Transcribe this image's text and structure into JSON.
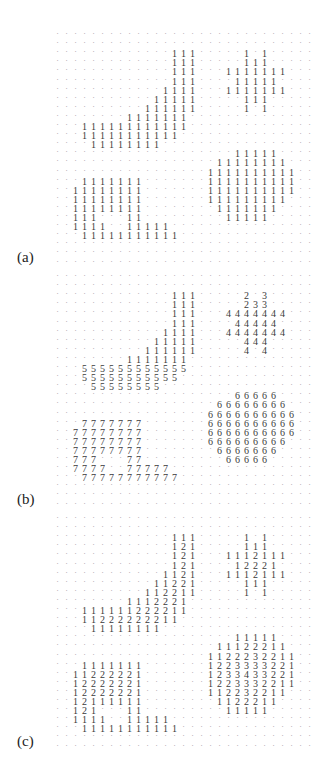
{
  "figure": {
    "columns": 29,
    "rows_per_panel": 26,
    "empty_symbol": "·",
    "panels": [
      {
        "label": "(a)",
        "description": "binary image (1 = foreground)",
        "rows": [
          ".............................",
          ".............................",
          ".............111.....1.1.....",
          ".............111.....111.....",
          ".............111...1111111...",
          ".............111....11111....",
          "............1111...1111111...",
          "...........11111.....111.....",
          "..........111111.....1.1.....",
          "........1111111..............",
          "...111111111111..............",
          "...11111111111...............",
          "....11111111.................",
          "....................11111....",
          "..................11111111...",
          ".................1111111111..",
          "...1111111.......1111111111..",
          "..11111111.......1111111111..",
          "..11111111.......111111111...",
          "..11111111........1111111....",
          "..111...11.........11111.....",
          "..1111..11111................",
          "...11111111111...............",
          ".............................",
          ".............................",
          "............................."
        ]
      },
      {
        "label": "(b)",
        "description": "connected component labels",
        "rows": [
          ".............................",
          ".............................",
          ".............111.....2.3.....",
          ".............111.....233.....",
          ".............111...4444444...",
          ".............111....44444....",
          "............1111...4444444...",
          "...........11111.....444.....",
          "..........111111.....4.4.....",
          "........1111111..............",
          "...555555555555..............",
          "...55555555555...............",
          "....55555555.................",
          "....................66666....",
          "..................66666666...",
          ".................6666666666..",
          "...7777777.......6666666666..",
          "..77777777.......6666666666..",
          "..77777777.......666666666...",
          "..77777777........6666666....",
          "..777...77.........66666.....",
          "..7777..77777................",
          "...77777777777...............",
          ".............................",
          ".............................",
          "............................."
        ]
      },
      {
        "label": "(c)",
        "description": "distance transform values",
        "rows": [
          ".............................",
          ".............................",
          ".............111.....1.1.....",
          ".............121.....111.....",
          ".............121...1112111...",
          ".............121....12221....",
          "............1121...1112111...",
          "...........11221.....111.....",
          "..........112211.....1.1.....",
          "........1112221..............",
          "...111111222211..............",
          "...11222222211...............",
          "....11111111.................",
          "....................11111....",
          "..................11122211...",
          ".................1122232211..",
          "...1111111.......1223333221..",
          "..11222221.......1233433221..",
          "..12222221.......1223332211..",
          "..12222221.......112232211...",
          "..12111111........1122211....",
          "..121...11.........11111.....",
          "..1111..11111................",
          "...11111111111...............",
          ".............................",
          "............................."
        ]
      }
    ]
  }
}
